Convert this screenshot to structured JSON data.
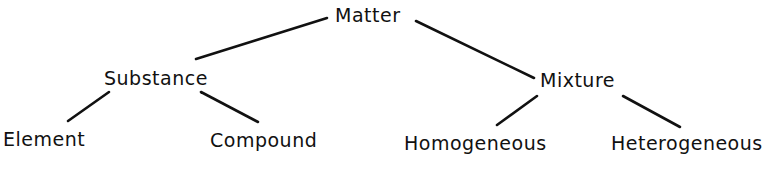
{
  "diagram": {
    "type": "tree",
    "colors": {
      "ink": "#111111",
      "background": "#ffffff"
    },
    "nodes": {
      "matter": {
        "label": "Matter"
      },
      "substance": {
        "label": "Substance"
      },
      "mixture": {
        "label": "Mixture"
      },
      "element": {
        "label": "Element"
      },
      "compound": {
        "label": "Compound"
      },
      "homogeneous": {
        "label": "Homogeneous"
      },
      "heterogeneous": {
        "label": "Heterogeneous"
      }
    },
    "edges": [
      {
        "from": "Matter",
        "to": "Substance"
      },
      {
        "from": "Matter",
        "to": "Mixture"
      },
      {
        "from": "Substance",
        "to": "Element"
      },
      {
        "from": "Substance",
        "to": "Compound"
      },
      {
        "from": "Mixture",
        "to": "Homogeneous"
      },
      {
        "from": "Mixture",
        "to": "Heterogeneous"
      }
    ]
  }
}
